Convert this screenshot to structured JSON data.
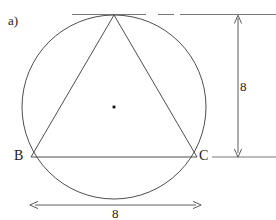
{
  "figure": {
    "part_label": "a)",
    "type": "circle-with-inscribed-triangle",
    "vertices": {
      "b_label": "B",
      "c_label": "C"
    },
    "dimensions": {
      "height_label": "8",
      "width_label": "8"
    },
    "colors": {
      "stroke": "#3a3a3a",
      "dimension_stroke": "#4a4a4a",
      "center_dot": "#111111",
      "text": "#1a1a1a",
      "background": "#ffffff"
    },
    "geometry": {
      "circle_center_x": 114,
      "circle_center_y": 107,
      "circle_radius": 92,
      "apex_x": 114,
      "apex_y": 15,
      "b_x": 31,
      "b_y": 157,
      "c_x": 197,
      "c_y": 157
    }
  }
}
